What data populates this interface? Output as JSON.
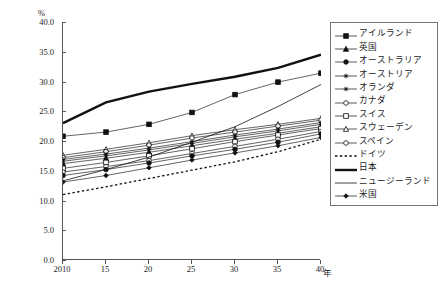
{
  "chart": {
    "unit_label": "%",
    "xaxis_label": "年",
    "yticks": [
      "0.0",
      "5.0",
      "10.0",
      "15.0",
      "20.0",
      "25.0",
      "30.0",
      "35.0",
      "40.0"
    ],
    "xticks": [
      "2010",
      "15",
      "20",
      "25",
      "30",
      "35",
      "40"
    ]
  },
  "legend": {
    "items": [
      {
        "label": "アイルランド",
        "marker": "filled-square",
        "style": "solid"
      },
      {
        "label": "英国",
        "marker": "filled-triangle",
        "style": "solid"
      },
      {
        "label": "オーストラリア",
        "marker": "filled-circle",
        "style": "solid"
      },
      {
        "label": "オーストリア",
        "marker": "asterisk",
        "style": "solid"
      },
      {
        "label": "オランダ",
        "marker": "asterisk",
        "style": "solid"
      },
      {
        "label": "カナダ",
        "marker": "open-circle",
        "style": "solid"
      },
      {
        "label": "スイス",
        "marker": "open-square",
        "style": "solid"
      },
      {
        "label": "スウェーデン",
        "marker": "open-triangle",
        "style": "solid"
      },
      {
        "label": "スペイン",
        "marker": "open-circle",
        "style": "solid"
      },
      {
        "label": "ドイツ",
        "marker": "none",
        "style": "dotted"
      },
      {
        "label": "日本",
        "marker": "none",
        "style": "thick"
      },
      {
        "label": "ニュージーランド",
        "marker": "none",
        "style": "thin"
      },
      {
        "label": "米国",
        "marker": "small-diamond",
        "style": "solid"
      }
    ]
  },
  "chart_data": {
    "type": "line",
    "title": "",
    "xlabel": "年",
    "ylabel": "%",
    "x": [
      2010,
      2015,
      2020,
      2025,
      2030,
      2035,
      2040
    ],
    "xlim": [
      2010,
      2040
    ],
    "ylim": [
      0.0,
      40.0
    ],
    "ytick_values": [
      0.0,
      5.0,
      10.0,
      15.0,
      20.0,
      25.0,
      30.0,
      35.0,
      40.0
    ],
    "grid": false,
    "legend_position": "right",
    "series": [
      {
        "name": "日本",
        "values": [
          23.0,
          26.5,
          28.3,
          29.6,
          30.8,
          32.3,
          34.5
        ]
      },
      {
        "name": "アイルランド",
        "values": [
          20.8,
          21.5,
          22.8,
          24.8,
          27.8,
          29.9,
          31.4
        ]
      },
      {
        "name": "ニュージーランド",
        "values": [
          13.3,
          15.2,
          17.3,
          19.8,
          22.4,
          25.8,
          29.5
        ]
      },
      {
        "name": "スウェーデン",
        "values": [
          17.6,
          18.6,
          19.7,
          20.9,
          21.9,
          22.8,
          23.8
        ]
      },
      {
        "name": "カナダ",
        "values": [
          17.2,
          18.2,
          19.3,
          20.5,
          21.5,
          22.5,
          23.5
        ]
      },
      {
        "name": "オーストリア",
        "values": [
          16.9,
          17.8,
          18.8,
          19.9,
          21.0,
          22.0,
          23.1
        ]
      },
      {
        "name": "オランダ",
        "values": [
          16.6,
          17.5,
          18.5,
          19.6,
          20.7,
          21.7,
          22.8
        ]
      },
      {
        "name": "英国",
        "values": [
          16.2,
          17.1,
          18.1,
          19.2,
          20.3,
          21.3,
          22.4
        ]
      },
      {
        "name": "スイス",
        "values": [
          15.4,
          16.4,
          17.5,
          18.7,
          19.9,
          21.0,
          22.1
        ]
      },
      {
        "name": "スペイン",
        "values": [
          14.8,
          15.7,
          16.7,
          17.9,
          19.1,
          20.3,
          21.6
        ]
      },
      {
        "name": "オーストラリア",
        "values": [
          14.2,
          15.2,
          16.3,
          17.5,
          18.6,
          19.8,
          21.2
        ]
      },
      {
        "name": "米国",
        "values": [
          13.1,
          14.2,
          15.5,
          16.8,
          18.0,
          19.2,
          20.6
        ]
      },
      {
        "name": "ドイツ",
        "values": [
          11.0,
          12.3,
          13.7,
          15.1,
          16.5,
          18.2,
          20.3
        ]
      }
    ]
  }
}
